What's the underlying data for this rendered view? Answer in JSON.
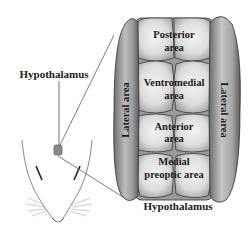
{
  "diagram": {
    "title": "Hypothalamus",
    "pointer_label": "Hypothalamus",
    "regions": {
      "posterior": [
        "Posterior",
        "area"
      ],
      "ventromedial": [
        "Ventromedial",
        "area"
      ],
      "anterior": [
        "Anterior",
        "area"
      ],
      "medial_preoptic": [
        "Medial",
        "preoptic area"
      ],
      "lateral_left": "Lateral area",
      "lateral_right": "Lateral area"
    },
    "colors": {
      "lobe_light": "#e6e6e6",
      "lobe_shadow": "#9a9a9a",
      "outline": "#3a3a3a",
      "text": "#1a1a1a"
    }
  }
}
